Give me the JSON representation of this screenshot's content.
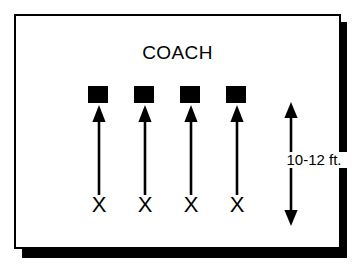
{
  "diagram": {
    "title": "COACH",
    "frame": {
      "border_color": "#000000",
      "background_color": "#ffffff",
      "shadow_color": "#000000"
    },
    "targets": {
      "icon": "filled-square-icon",
      "color": "#000000",
      "count": 4
    },
    "arrows": {
      "icon": "arrow-up-icon",
      "color": "#000000",
      "count": 4
    },
    "players": [
      {
        "label": "X"
      },
      {
        "label": "X"
      },
      {
        "label": "X"
      },
      {
        "label": "X"
      }
    ],
    "measurement": {
      "label": "10-12 ft.",
      "icon": "double-headed-vertical-arrow-icon",
      "color": "#000000"
    }
  }
}
